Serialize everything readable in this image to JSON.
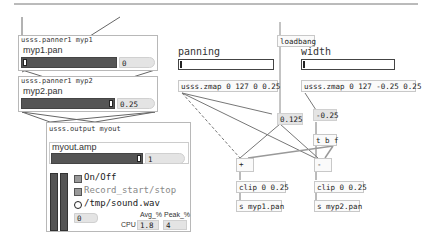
{
  "panner1": {
    "title": "usss.panner1 myp1",
    "param": "myp1.pan",
    "value": "0"
  },
  "panner2": {
    "title": "usss.panner1 myp2",
    "param": "myp2.pan",
    "value": "0.25"
  },
  "output": {
    "title": "usss.output myout",
    "param": "myout.amp",
    "amp_value": "1",
    "onoff_label": "On/Off",
    "record_label": "Record_start/stop",
    "file_label": "/tmp/sound.wav",
    "counter_value": "0",
    "cpu_label": "CPU",
    "avg_label": "Avg_%",
    "peak_label": "Peak_%",
    "avg_value": "1.8",
    "peak_value": "4"
  },
  "controls": {
    "panning_label": "panning",
    "width_label": "width",
    "loadbang": "loadbang",
    "zmap_panning": "usss.zmap 0 127 0 0.25",
    "zmap_width": "usss.zmap 0 127 -0.25 0.25",
    "num_0125": "0.125",
    "num_neg025": "-0.25",
    "trigger": "t b f",
    "plus": "+",
    "minus": "-",
    "clip1": "clip 0 0.25",
    "clip2": "clip 0 0.25",
    "send1": "s myp1.pan",
    "send2": "s myp2.pan"
  }
}
